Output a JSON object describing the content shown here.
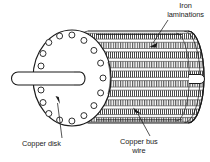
{
  "figure": {
    "background_color": "#ffffff",
    "ink_color": "#1b1b1b",
    "hatch_color": "#4a4a4a"
  },
  "labels": {
    "iron_laminations": {
      "line1": "Iron",
      "line2": "laminations"
    },
    "copper_disk": {
      "line1": "Copper disk"
    },
    "copper_bus_wire": {
      "line1": "Copper bus",
      "line2": "wire"
    }
  },
  "parts": {
    "copper_disk": {
      "name": "Copper disk",
      "bolt_hole_count": 16,
      "center_x": 72,
      "center_y": 78,
      "radius_x": 39,
      "radius_y": 48,
      "bolt_circle_radius_x": 31,
      "bolt_circle_radius_y": 39,
      "bolt_hole_radius": 3.0
    },
    "shaft_left": {
      "name": "Left shaft stub",
      "x": 12,
      "y": 72,
      "width": 62,
      "height": 13
    },
    "shaft_right": {
      "name": "Right shaft stub",
      "x": 189,
      "y": 74,
      "width": 16,
      "height": 9
    },
    "cylinder": {
      "name": "Laminated rotor body",
      "left_x": 88,
      "right_x": 188,
      "center_y": 77,
      "radius_y": 46,
      "end_cap_radius_x": 16,
      "band_count": 10
    }
  },
  "leaders": [
    {
      "name": "iron-laminations-leader",
      "from_x": 168,
      "from_y": 20,
      "to_x": 152,
      "to_y": 44
    },
    {
      "name": "copper-disk-leader",
      "from_x": 62,
      "from_y": 138,
      "to_x": 57,
      "to_y": 100
    },
    {
      "name": "copper-bus-wire-leader",
      "from_x": 148,
      "from_y": 136,
      "to_x": 137,
      "to_y": 112
    }
  ]
}
